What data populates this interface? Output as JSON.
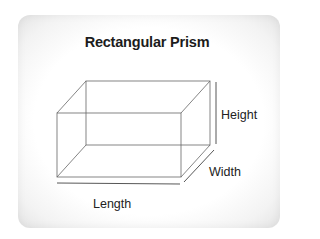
{
  "diagram": {
    "title": "Rectangular Prism",
    "labels": {
      "height": "Height",
      "width": "Width",
      "length": "Length"
    },
    "shape": "rectangular-prism",
    "colors": {
      "line": "#555555",
      "text": "#222222",
      "background": "#ffffff"
    }
  }
}
